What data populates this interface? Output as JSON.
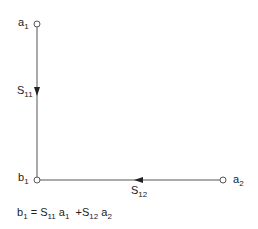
{
  "diagram": {
    "type": "signal-flow-graph",
    "nodes": [
      {
        "id": "a1",
        "label": "a",
        "sub": "1"
      },
      {
        "id": "b1",
        "label": "b",
        "sub": "1"
      },
      {
        "id": "a2",
        "label": "a",
        "sub": "2"
      }
    ],
    "edges": [
      {
        "from": "a1",
        "to": "b1",
        "label": "S",
        "sub": "11"
      },
      {
        "from": "a2",
        "to": "b1",
        "label": "S",
        "sub": "12"
      }
    ],
    "equation": {
      "lhs": "b",
      "lhs_sub": "1",
      "eq": "=",
      "t1_s": "S",
      "t1_s_sub": "11",
      "t1_a": "a",
      "t1_a_sub": "1",
      "plus": "+",
      "t2_s": "S",
      "t2_s_sub": "12",
      "t2_a": "a",
      "t2_a_sub": "2"
    },
    "colors": {
      "line": "#555555",
      "text": "#222222",
      "node_fill": "#ffffff"
    }
  }
}
